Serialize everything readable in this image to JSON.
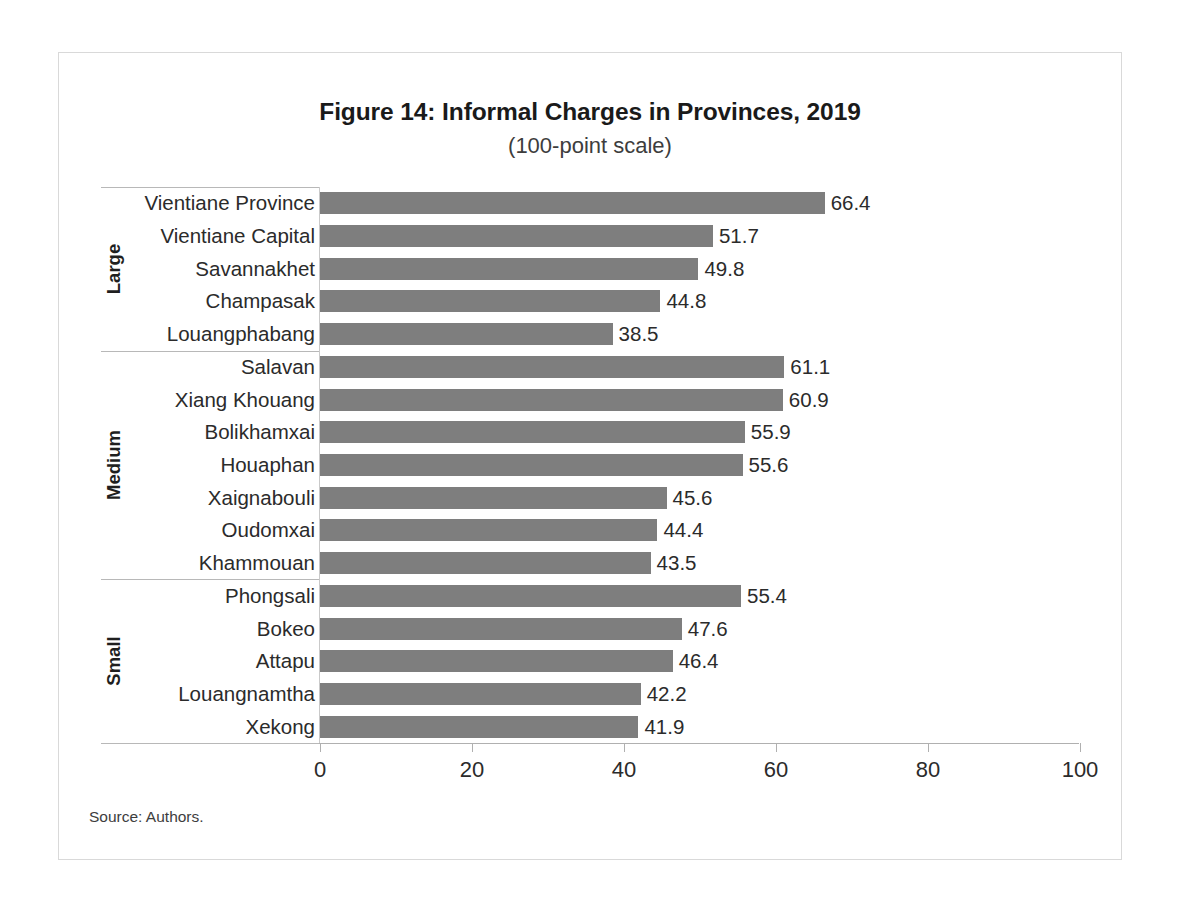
{
  "figure": {
    "title": "Figure 14: Informal Charges in Provinces, 2019",
    "subtitle": "(100-point scale)",
    "source": "Source: Authors."
  },
  "chart_data": {
    "type": "bar",
    "orientation": "horizontal",
    "title": "Figure 14: Informal Charges in Provinces, 2019",
    "subtitle": "(100-point scale)",
    "xlabel": "",
    "ylabel": "",
    "xlim": [
      0,
      100
    ],
    "xticks": [
      0,
      20,
      40,
      60,
      80,
      100
    ],
    "xtick_labels": [
      "0",
      "20",
      "40",
      "60",
      "80",
      "100"
    ],
    "grid": false,
    "legend": false,
    "bar_color": "#7e7e7e",
    "value_label_format": "one-decimal",
    "groups": [
      {
        "name": "Large",
        "categories": [
          "Vientiane Province",
          "Vientiane Capital",
          "Savannakhet",
          "Champasak",
          "Louangphabang"
        ],
        "values": [
          66.4,
          51.7,
          49.8,
          44.8,
          38.5
        ]
      },
      {
        "name": "Medium",
        "categories": [
          "Salavan",
          "Xiang Khouang",
          "Bolikhamxai",
          "Houaphan",
          "Xaignabouli",
          "Oudomxai",
          "Khammouan"
        ],
        "values": [
          61.1,
          60.9,
          55.9,
          55.6,
          45.6,
          44.4,
          43.5
        ]
      },
      {
        "name": "Small",
        "categories": [
          "Phongsali",
          "Bokeo",
          "Attapu",
          "Louangnamtha",
          "Xekong"
        ],
        "values": [
          55.4,
          47.6,
          46.4,
          42.2,
          41.9
        ]
      }
    ],
    "categories": [
      "Vientiane Province",
      "Vientiane Capital",
      "Savannakhet",
      "Champasak",
      "Louangphabang",
      "Salavan",
      "Xiang Khouang",
      "Bolikhamxai",
      "Houaphan",
      "Xaignabouli",
      "Oudomxai",
      "Khammouan",
      "Phongsali",
      "Bokeo",
      "Attapu",
      "Louangnamtha",
      "Xekong"
    ],
    "values": [
      66.4,
      51.7,
      49.8,
      44.8,
      38.5,
      61.1,
      60.9,
      55.9,
      55.6,
      45.6,
      44.4,
      43.5,
      55.4,
      47.6,
      46.4,
      42.2,
      41.9
    ],
    "value_labels": [
      "66.4",
      "51.7",
      "49.8",
      "44.8",
      "38.5",
      "61.1",
      "60.9",
      "55.9",
      "55.6",
      "45.6",
      "44.4",
      "43.5",
      "55.4",
      "47.6",
      "46.4",
      "42.2",
      "41.9"
    ]
  }
}
